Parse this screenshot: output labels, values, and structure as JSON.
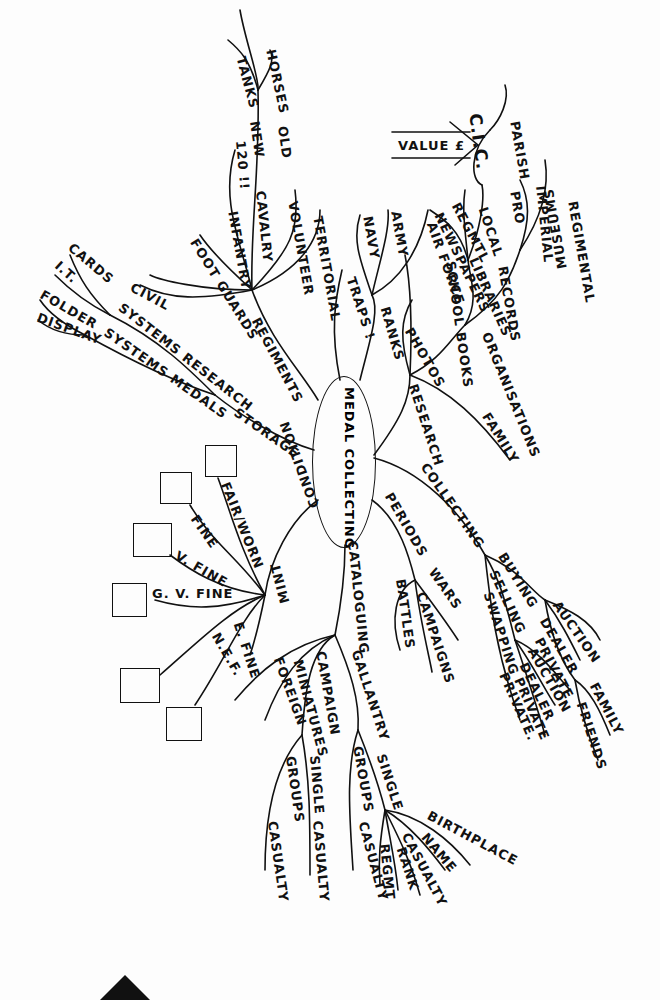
{
  "center": {
    "label": "MEDAL COLLECTING"
  },
  "branches": {
    "regiments": {
      "label": "REGIMENTS",
      "children": {
        "infantry": "INFANTRY",
        "cavalry": "CAVALRY",
        "volunteer": "VOLUNTEER",
        "territorial": "TERRITORIAL",
        "foot_guards": "FOOT GUARDS",
        "civil": "CIVIL"
      },
      "cavalry_children": {
        "tanks": "TANKS",
        "horses": "HORSES",
        "new": "NEW",
        "old": "OLD",
        "i20": "120 !!"
      }
    },
    "traps": {
      "label": "TRAPS !"
    },
    "ranks": {
      "label": "RANKS",
      "children": {
        "navy": "NAVY",
        "army": "ARMY",
        "air_force": "AIR FORCE"
      }
    },
    "research": {
      "label": "RESEARCH",
      "children": {
        "photos": "PHOTOS",
        "school_books": "SCHOOL BOOKS",
        "organisations": "ORGANISATIONS",
        "family": "FAMILY"
      },
      "organisations_children": {
        "records": "RECORDS",
        "museums": "MUSEUMS",
        "regmtl": "REGMTL",
        "newspapers": "NEWSPAPERS",
        "libraries": "LIBRARIES",
        "local": "LOCAL",
        "pro": "PRO",
        "imperial": "IMPERIAL",
        "regimental": "REGIMENTAL",
        "parish": "PARISH"
      },
      "cic": "C.I.C.",
      "value": "VALUE £"
    },
    "collecting": {
      "label": "COLLECTING",
      "children": {
        "buying": "BUYING",
        "selling": "SELLING",
        "swapping": "SWAPPING"
      },
      "buying_children": [
        "AUCTION",
        "DEALER",
        "PRIVATE"
      ],
      "selling_children": [
        "AUCTION",
        "DEALER",
        "PRIVATE"
      ],
      "swapping_children": [
        "PRIVATE."
      ],
      "private_children": [
        "FAMILY",
        "FRIENDS"
      ]
    },
    "periods": {
      "label": "PERIODS",
      "children": {
        "wars": "WARS",
        "campaigns": "CAMPAIGNS",
        "battles": "BATTLES"
      }
    },
    "cataloguing": {
      "label": "CATALOGUING",
      "children": {
        "gallantry": "GALLANTRY",
        "campaign": "CAMPAIGN",
        "miniatures": "MINIATURES",
        "foreign": "FOREIGN"
      },
      "gallantry_children": {
        "single": "SINGLE",
        "groups": "GROUPS",
        "casualty": "CASUALTY"
      },
      "campaign_children": {
        "single": "SINGLE",
        "groups": "GROUPS",
        "casualty1": "CASUALTY",
        "casualty2": "CASUALTY"
      },
      "single_children": {
        "birthplace": "BIRTHPLACE",
        "name": "NAME",
        "casualty": "CASUALTY",
        "rank": "RANK",
        "regmt": "REGMT"
      }
    },
    "condition": {
      "label": "CONDITION",
      "children": {
        "mint": "MINT",
        "e_fine": "E. FINE",
        "nef": "N.E.F.",
        "gv_fine": "G. V. FINE",
        "v_fine": "V. FINE",
        "fine": "FINE",
        "fair_worn": "FAIR/WORN"
      }
    },
    "storage": {
      "label": "STORAGE",
      "children": {
        "systems_research": "SYSTEMS RESEARCH",
        "systems_medals": "SYSTEMS MEDALS",
        "cards": "CARDS",
        "it": "I.T.",
        "folder": "FOLDER",
        "display": "DISPLAY"
      }
    }
  }
}
